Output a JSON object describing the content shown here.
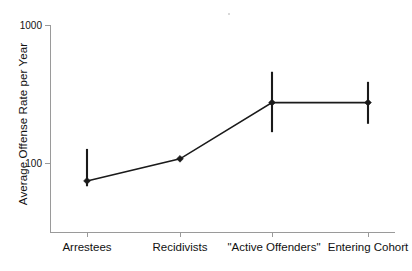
{
  "chart_data": {
    "type": "line",
    "title": "",
    "subtitle": "",
    "xlabel": "",
    "ylabel": "Average Offense Rate per Year",
    "yscale": "log",
    "ylim": [
      1,
      1000
    ],
    "ytick_labels": [
      "1000",
      "100",
      "10",
      "1"
    ],
    "ytick_values": [
      1000,
      100,
      10,
      1
    ],
    "grid": false,
    "legend": null,
    "categories": [
      "Arrestees",
      "Recidivists",
      "\"Active Offenders\"",
      "Entering Cohort"
    ],
    "values": [
      5.5,
      11.5,
      75,
      75
    ],
    "error_low": [
      4.6,
      11.5,
      28,
      37
    ],
    "error_high": [
      16,
      11.5,
      210,
      150
    ],
    "series": [
      {
        "name": "Average offense rate",
        "values": [
          5.5,
          11.5,
          75,
          75
        ],
        "error_low": [
          4.6,
          11.5,
          28,
          37
        ],
        "error_high": [
          16,
          11.5,
          210,
          150
        ],
        "marker": "diamond",
        "color": "#1a1a1a"
      }
    ],
    "points": [
      {
        "category": "Arrestees",
        "value": 5.5,
        "low": 4.6,
        "high": 16
      },
      {
        "category": "Recidivists",
        "value": 11.5,
        "low": 11.5,
        "high": 11.5
      },
      {
        "category": "\"Active Offenders\"",
        "value": 75,
        "low": 28,
        "high": 210
      },
      {
        "category": "Entering Cohort",
        "value": 75,
        "low": 37,
        "high": 150
      }
    ]
  },
  "axes": {
    "y_title": "Average Offense Rate per Year",
    "y_ticks": [
      {
        "label": "1000"
      },
      {
        "label": "100"
      },
      {
        "label": "10"
      },
      {
        "label": "1"
      }
    ],
    "x_ticks": [
      {
        "label": "Arrestees"
      },
      {
        "label": "Recidivists"
      },
      {
        "label": "\"Active Offenders\""
      },
      {
        "label": "Entering Cohort"
      }
    ]
  },
  "colors": {
    "axis": "#9a9a9a",
    "series": "#1a1a1a",
    "text": "#111111",
    "background": "#ffffff"
  }
}
